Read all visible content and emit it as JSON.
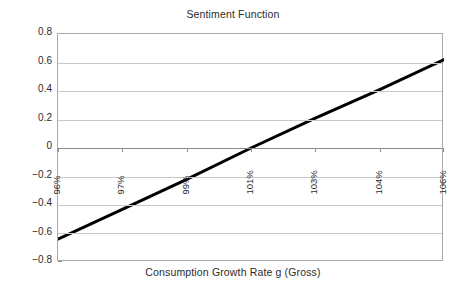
{
  "chart_data": {
    "type": "line",
    "title": "Sentiment Function",
    "xlabel": "Consumption Growth Rate g (Gross)",
    "ylabel": "",
    "grid": true,
    "legend": "none",
    "ylim": [
      -0.8,
      0.8
    ],
    "ytick_labels": [
      "0.8",
      "0.6",
      "0.4",
      "0.2",
      "0",
      "−0.2",
      "−0.4",
      "−0.6",
      "−0.8"
    ],
    "ytick_values": [
      0.8,
      0.6,
      0.4,
      0.2,
      0,
      -0.2,
      -0.4,
      -0.6,
      -0.8
    ],
    "categories": [
      "96%",
      "97%",
      "99%",
      "101%",
      "103%",
      "104%",
      "106%"
    ],
    "xtick_rotation": 90,
    "series": [
      {
        "name": "Sentiment",
        "color": "#000000",
        "width": 3,
        "values": [
          -0.64,
          -0.43,
          -0.22,
          0.0,
          0.21,
          0.41,
          0.62
        ]
      }
    ]
  },
  "chart": {
    "title": "Sentiment Function",
    "x_axis_title": "Consumption Growth Rate g (Gross)"
  }
}
